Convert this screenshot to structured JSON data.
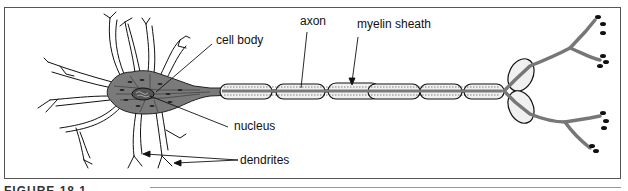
{
  "figure": {
    "caption": "FIGURE 18.1",
    "labels": {
      "cell_body": "cell body",
      "axon": "axon",
      "myelin_sheath": "myelin sheath",
      "nucleus": "nucleus",
      "dendrites": "dendrites"
    },
    "colors": {
      "cytoplasm": "#7a7a7a",
      "outline": "#111111",
      "myelin": "#e6e6e6",
      "frame": "#555555"
    }
  }
}
